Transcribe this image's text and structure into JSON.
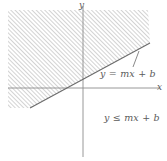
{
  "figure": {
    "type": "coordinate-plane-inequality",
    "axes": {
      "x_label": "x",
      "y_label": "y",
      "x_axis": {
        "y_pixel": 88,
        "x_start": 8,
        "x_end": 160
      },
      "y_axis": {
        "x_pixel": 83,
        "y_start": 6,
        "y_end": 157
      },
      "origin": {
        "x": 83,
        "y": 88
      },
      "color": "#8c8c8c"
    },
    "boundary_line": {
      "label": "y = mx + b",
      "style": "solid",
      "color": "#6b6b6b",
      "slope_sign": "positive",
      "y_intercept_sign": "positive",
      "x_intercept_pixel": {
        "x": 49,
        "y": 88
      },
      "y_intercept_pixel": {
        "x": 83,
        "y": 78
      },
      "endpoints_pixel": [
        {
          "x": 30,
          "y": 108
        },
        {
          "x": 150,
          "y": 43
        }
      ]
    },
    "shaded_region": {
      "label": "y ≤ mx + b",
      "fill": "hatch",
      "hatch_angle_degrees": 45,
      "hatch_spacing_px": 3,
      "hatch_color": "#a8a8a8",
      "side": "above-left-of-line",
      "note": "region bounded by the line and the figure edges"
    },
    "leader_line": {
      "from_pixel": {
        "x": 133,
        "y": 67
      },
      "to_pixel": {
        "x": 139,
        "y": 51
      },
      "color": "#6b6b6b"
    }
  }
}
